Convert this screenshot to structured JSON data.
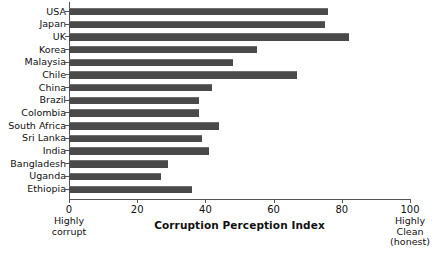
{
  "chart_data": {
    "type": "bar",
    "orientation": "horizontal",
    "title": "",
    "xlabel": "Corruption Perception Index",
    "ylabel": "",
    "xlim": [
      0,
      100
    ],
    "xticks": [
      0,
      20,
      40,
      60,
      80,
      100
    ],
    "grid": false,
    "legend": null,
    "bar_color": "#4a4a4a",
    "categories": [
      "USA",
      "Japan",
      "UK",
      "Korea",
      "Malaysia",
      "Chile",
      "China",
      "Brazil",
      "Colombia",
      "South Africa",
      "Sri Lanka",
      "India",
      "Bangladesh",
      "Uganda",
      "Ethiopia"
    ],
    "values": [
      76,
      75,
      82,
      55,
      48,
      67,
      42,
      38,
      38,
      44,
      39,
      41,
      29,
      27,
      36
    ],
    "annotations": {
      "left_end_label": [
        "Highly",
        "corrupt"
      ],
      "right_end_label": [
        "Highly",
        "Clean",
        "(honest)"
      ]
    }
  },
  "axis": {
    "tick_labels": [
      "0",
      "20",
      "40",
      "60",
      "80",
      "100"
    ],
    "title": "Corruption Perception Index"
  },
  "notes": {
    "left_line1": "Highly",
    "left_line2": "corrupt",
    "right_line1": "Highly",
    "right_line2": "Clean",
    "right_line3": "(honest)"
  }
}
